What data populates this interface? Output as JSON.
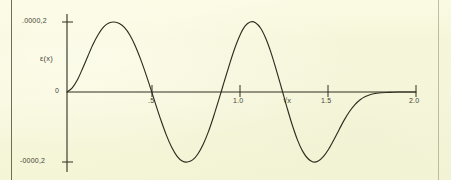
{
  "figure": {
    "background_color": "#f7f7dc",
    "ink_color": "#2e2e20",
    "page_edge_color": "#56563c"
  },
  "chart_data": {
    "type": "line",
    "title": "",
    "subtitle": "",
    "xlabel": "√x",
    "ylabel": "ε(x)",
    "grid": false,
    "legend": null,
    "xlim": [
      0.0,
      2.0
    ],
    "ylim": [
      -0.0002,
      0.0002
    ],
    "x_ticks": [
      {
        "value": 0.5,
        "label": ".5"
      },
      {
        "value": 1.0,
        "label": "1.0"
      },
      {
        "value": 1.5,
        "label": "1.5"
      },
      {
        "value": 2.0,
        "label": "2.0"
      }
    ],
    "y_ticks": [
      {
        "value": 0.0002,
        "label": ".0000,2"
      },
      {
        "value": 0.0,
        "label": "0"
      },
      {
        "value": -0.0002,
        "label": "-0000,2"
      }
    ],
    "series": [
      {
        "name": "ε(x)",
        "color": "#2e2e20",
        "x": [
          0.0,
          0.03,
          0.06,
          0.09,
          0.12,
          0.15,
          0.18,
          0.21,
          0.24,
          0.27,
          0.3,
          0.33,
          0.36,
          0.39,
          0.42,
          0.45,
          0.48,
          0.51,
          0.54,
          0.57,
          0.6,
          0.63,
          0.66,
          0.69,
          0.72,
          0.75,
          0.78,
          0.81,
          0.84,
          0.87,
          0.9,
          0.93,
          0.96,
          0.99,
          1.02,
          1.05,
          1.08,
          1.11,
          1.14,
          1.17,
          1.2,
          1.23,
          1.26,
          1.29,
          1.32,
          1.35,
          1.38,
          1.41,
          1.44,
          1.47,
          1.5,
          1.53,
          1.56,
          1.59,
          1.62,
          1.65,
          1.68,
          1.71,
          1.74,
          1.77,
          1.8,
          1.85,
          1.9,
          1.95,
          2.0
        ],
        "y": [
          0.0,
          1.2e-05,
          3.5e-05,
          6.8e-05,
          0.000103,
          0.000137,
          0.000165,
          0.000186,
          0.000197,
          0.0002,
          0.000196,
          0.000184,
          0.000163,
          0.000133,
          9.6e-05,
          5.4e-05,
          9e-06,
          -3.8e-05,
          -8.3e-05,
          -0.000124,
          -0.000158,
          -0.000183,
          -0.000197,
          -0.0002,
          -0.000194,
          -0.000177,
          -0.00015,
          -0.000114,
          -7e-05,
          -2.2e-05,
          2.8e-05,
          7.7e-05,
          0.000123,
          0.000161,
          0.000188,
          0.0002,
          0.000198,
          0.000182,
          0.000152,
          0.000111,
          6.2e-05,
          1e-05,
          -4.3e-05,
          -9.3e-05,
          -0.000136,
          -0.000169,
          -0.00019,
          -0.0002,
          -0.000197,
          -0.000184,
          -0.000163,
          -0.000136,
          -0.000107,
          -7.9e-05,
          -5.5e-05,
          -3.6e-05,
          -2.2e-05,
          -1.3e-05,
          -7e-06,
          -4e-06,
          -2e-06,
          -1e-06,
          0.0,
          0.0,
          0.0
        ]
      }
    ],
    "annotations": []
  }
}
